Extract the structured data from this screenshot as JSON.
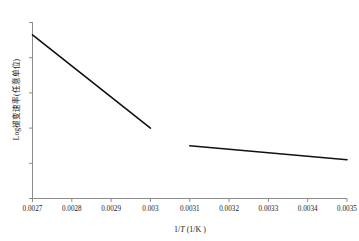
{
  "chart_data": {
    "type": "line",
    "title": "",
    "xlabel": "1/T (1/K)",
    "ylabel": "Log褪变速率(任意单位)",
    "xlim": [
      0.0027,
      0.0035
    ],
    "ylim": [
      0,
      1
    ],
    "grid": false,
    "legend": "none",
    "x_tick_labels": [
      "0.0027",
      "0.0028",
      "0.0029",
      "0.003",
      "0.0031",
      "0.0032",
      "0.0033",
      "0.0034",
      "0.0035"
    ],
    "x_tick_values": [
      0.0027,
      0.0028,
      0.0029,
      0.003,
      0.0031,
      0.0032,
      0.0033,
      0.0034,
      0.0035
    ],
    "y_tick_labels": [
      "",
      "",
      "",
      "",
      "",
      ""
    ],
    "y_axis_labeled": false,
    "series": [
      {
        "name": "high-temperature-branch",
        "color": "#111111",
        "x": [
          0.0027,
          0.003
        ],
        "values": [
          0.93,
          0.4
        ]
      },
      {
        "name": "low-temperature-branch",
        "color": "#111111",
        "x": [
          0.0031,
          0.0035
        ],
        "values": [
          0.3,
          0.22
        ]
      }
    ]
  },
  "axes": {
    "line_color": "#8c8c8c",
    "tick_color": "#8c8c8c"
  }
}
